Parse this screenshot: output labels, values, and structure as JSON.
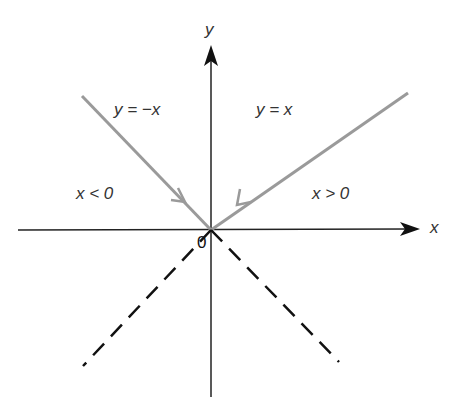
{
  "diagram": {
    "axes": {
      "x_label": "x",
      "y_label": "y",
      "origin_label": "0"
    },
    "lines": [
      {
        "equation": "y = -x",
        "style": "solid",
        "color": "#999999",
        "region": "x < 0"
      },
      {
        "equation": "y = x",
        "style": "solid",
        "color": "#999999",
        "region": "x > 0"
      }
    ],
    "regions": {
      "left": "x < 0",
      "right": "x > 0"
    },
    "dashed_extensions": [
      "lower-left",
      "lower-right"
    ]
  },
  "labels": {
    "y_axis": "y",
    "x_axis": "x",
    "origin": "0",
    "left_line": "y = −x",
    "right_line": "y = x",
    "left_region": "x < 0",
    "right_region": "x > 0"
  }
}
